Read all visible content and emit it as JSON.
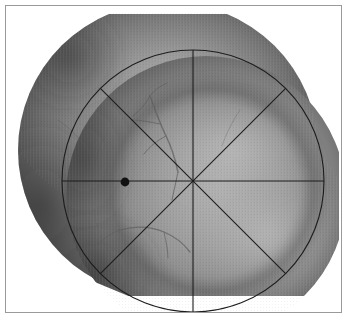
{
  "figure": {
    "domain": "Natural-Image",
    "kind": "retinal-fundus-photograph-montage",
    "caption": "",
    "title": "",
    "has_text_labels": false,
    "border": {
      "visible": true,
      "color": "#9a9a9a",
      "thickness_px": 1,
      "inset_px": 5
    },
    "background_color": "#ffffff"
  },
  "image_content": {
    "modality": "color fundus photography rendered grayscale",
    "description": "Two overlapping circular fundus frames forming a montage, with a visible horizontal stitching seam across the upper third and retinal vessels arcing through the centre.",
    "tones": {
      "background_white": "#ffffff",
      "retina_mid": "#8d8d8d",
      "retina_light": "#a6a6a6",
      "retina_highlight": "#b4b4b4",
      "retina_dark": "#4e4e4e",
      "retina_darkest": "#333333",
      "vessel": "#5d5d5d"
    },
    "seam": {
      "present": true,
      "orientation": "horizontal",
      "y_px": 95
    },
    "frames": [
      {
        "name": "upper-left-fundus-frame",
        "cx": 168,
        "cy": 150,
        "rx": 150,
        "ry": 148
      },
      {
        "name": "lower-right-fundus-frame",
        "cx": 206,
        "cy": 196,
        "rx": 140,
        "ry": 140
      }
    ]
  },
  "overlay": {
    "name": "radial-grid-overlay",
    "stroke_color": "#1c1c1c",
    "stroke_width_px": 1.1,
    "circle": {
      "name": "analysis-circle",
      "center_x": 193,
      "center_y": 181,
      "radius_px": 131
    },
    "spokes": {
      "count": 8,
      "angles_deg": [
        0,
        45,
        90,
        135,
        180,
        225,
        270,
        315
      ],
      "description": "Four full-diameter chords through the circle centre at 45 degree increments, producing eight equal sectors."
    },
    "marker": {
      "name": "reference-point-marker",
      "shape": "filled-circle",
      "center_x": 125,
      "center_y": 182,
      "radius_px": 4.4,
      "color": "#111111"
    }
  }
}
